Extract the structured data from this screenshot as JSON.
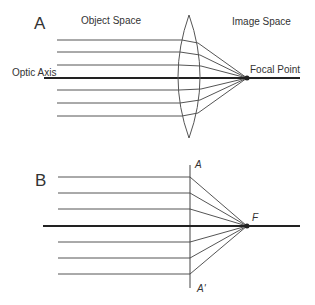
{
  "panel_a": {
    "label": "A",
    "object_space": "Object Space",
    "image_space": "Image Space",
    "optic_axis": "Optic Axis",
    "focal_point": "Focal Point"
  },
  "panel_b": {
    "label": "B",
    "plane_top": "A",
    "plane_bottom": "A'",
    "focal": "F"
  },
  "colors": {
    "line": "#444444",
    "axis": "#222222"
  }
}
